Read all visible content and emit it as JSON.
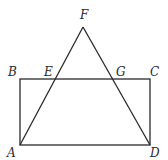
{
  "figure": {
    "type": "geometry",
    "stroke_color": "#2a2a2a",
    "points": {
      "A": {
        "label": "A",
        "x": 20,
        "y": 145
      },
      "B": {
        "label": "B",
        "x": 20,
        "y": 79
      },
      "C": {
        "label": "C",
        "x": 150,
        "y": 79
      },
      "D": {
        "label": "D",
        "x": 150,
        "y": 145
      },
      "E": {
        "label": "E",
        "x": 54,
        "y": 79
      },
      "F": {
        "label": "F",
        "x": 83,
        "y": 27
      },
      "G": {
        "label": "G",
        "x": 114,
        "y": 79
      }
    },
    "segments": [
      "AB",
      "BC",
      "CD",
      "DA",
      "AF",
      "FD"
    ]
  }
}
